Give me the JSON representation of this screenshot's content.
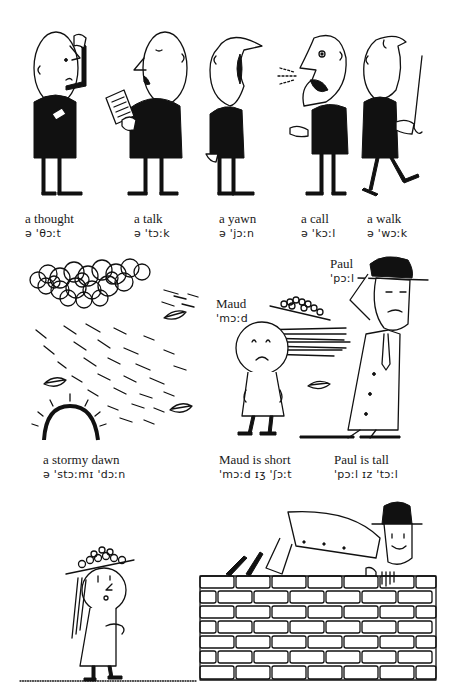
{
  "page": {
    "background": "#ffffff",
    "ink_color": "#111111"
  },
  "row1": {
    "captions": [
      {
        "word": "a thought",
        "ipa": "ə 'θɔːt"
      },
      {
        "word": "a talk",
        "ipa": "ə 'tɔːk"
      },
      {
        "word": "a yawn",
        "ipa": "ə 'jɔːn"
      },
      {
        "word": "a call",
        "ipa": "ə 'kɔːl"
      },
      {
        "word": "a walk",
        "ipa": "ə 'wɔːk"
      }
    ]
  },
  "row2": {
    "labels": {
      "maud": {
        "word": "Maud",
        "ipa": "'mɔːd"
      },
      "paul": {
        "word": "Paul",
        "ipa": "'pɔːl"
      }
    },
    "captions": [
      {
        "word": "a stormy dawn",
        "ipa": "ə 'stɔːmɪ 'dɔːn"
      },
      {
        "word": "Maud is short",
        "ipa": "'mɔːd ɪʒ 'ʃɔːt"
      },
      {
        "word": "Paul is tall",
        "ipa": "'pɔːl ɪz  'tɔːl"
      }
    ]
  },
  "illustrations": {
    "row1": [
      "man-thinking",
      "man-reading-talking",
      "man-yawning",
      "man-calling",
      "man-walking-with-cane"
    ],
    "row2": [
      "storm-cloud-rising-sun",
      "maud-in-wind",
      "paul-holding-hat"
    ],
    "row3": [
      "girl-in-flower-hat",
      "paul-lying-on-brick-wall"
    ]
  }
}
